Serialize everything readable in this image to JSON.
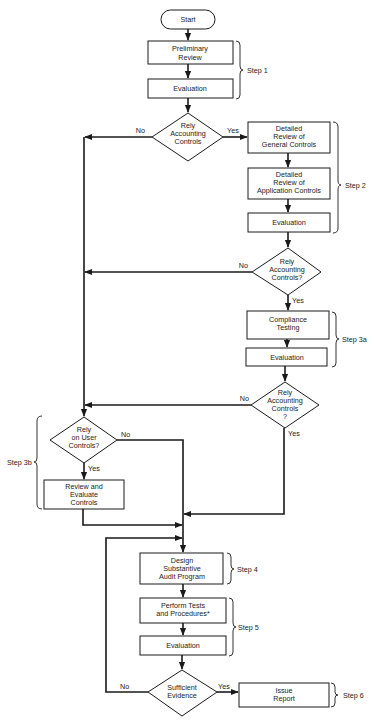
{
  "diagram": {
    "type": "flowchart",
    "nodes": {
      "start": {
        "label": [
          "Start"
        ]
      },
      "preliminary_review": {
        "label": [
          "Preliminary",
          "Review"
        ]
      },
      "evaluation_1": {
        "label": [
          "Evaluation"
        ]
      },
      "decision_1": {
        "label": [
          "Rely",
          "Accounting",
          "Controls"
        ]
      },
      "detailed_general": {
        "label": [
          "Detailed",
          "Review of",
          "General Controls"
        ]
      },
      "detailed_application": {
        "label": [
          "Detailed",
          "Review of",
          "Application Controls"
        ]
      },
      "evaluation_2": {
        "label": [
          "Evaluation"
        ]
      },
      "decision_2": {
        "label": [
          "Rely",
          "Accounting",
          "Controls?"
        ]
      },
      "compliance_testing": {
        "label": [
          "Compliance",
          "Testing"
        ]
      },
      "evaluation_3a": {
        "label": [
          "Evaluation"
        ]
      },
      "decision_3": {
        "label": [
          "Rely",
          "Accounting",
          "Controls",
          "?"
        ]
      },
      "decision_user": {
        "label": [
          "Rely",
          "on User",
          "Controls?"
        ]
      },
      "review_evaluate": {
        "label": [
          "Review and",
          "Evaluate",
          "Controls"
        ]
      },
      "design_program": {
        "label": [
          "Design",
          "Substantive",
          "Audit Program"
        ]
      },
      "perform_tests": {
        "label": [
          "Perform Tests",
          "and Procedures*"
        ]
      },
      "evaluation_5": {
        "label": [
          "Evaluation"
        ]
      },
      "decision_sufficient": {
        "label": [
          "Sufficient",
          "Evidence"
        ]
      },
      "issue_report": {
        "label": [
          "Issue",
          "Report"
        ]
      }
    },
    "edge_labels": {
      "yes": "Yes",
      "no": "No"
    },
    "steps": {
      "step1": "Step 1",
      "step2": "Step 2",
      "step3a": "Step 3a",
      "step3b": "Step 3b",
      "step4": "Step 4",
      "step5": "Step 5",
      "step6": "Step 6"
    },
    "colors": {
      "line": "#1a1a1a",
      "background": "#ffffff",
      "text": "#222222"
    }
  }
}
